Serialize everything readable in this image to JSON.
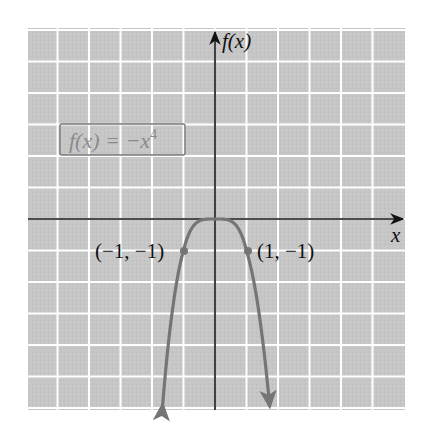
{
  "chart_data": {
    "type": "line",
    "title": "",
    "function_label": "f(x) = −x⁴",
    "xlabel": "x",
    "ylabel": "f(x)",
    "grid": true,
    "grid_step": 1,
    "xlim": [
      -5.9,
      6.0
    ],
    "ylim": [
      -6.0,
      5.9
    ],
    "series": [
      {
        "name": "f(x) = -x^4",
        "expression": "-x^4",
        "x": [
          -1.6,
          -1.2,
          -1.0,
          -0.8,
          -0.5,
          0,
          0.5,
          0.8,
          1.0,
          1.2,
          1.6
        ],
        "y": [
          -6.55,
          -2.07,
          -1,
          -0.41,
          -0.06,
          0,
          -0.06,
          -0.41,
          -1,
          -2.07,
          -6.55
        ]
      }
    ],
    "annotations": [
      {
        "point": [
          -1,
          -1
        ],
        "label": "(−1, −1)"
      },
      {
        "point": [
          1,
          -1
        ],
        "label": "(1, −1)"
      }
    ]
  },
  "labels": {
    "y_axis": "f(x)",
    "x_axis": "x",
    "function": "f(x) = −x",
    "function_exp": "4",
    "point_left": "(−1, −1)",
    "point_right": "(1, −1)"
  },
  "colors": {
    "grid_fill": "#c6c6c6",
    "grid_line": "#ffffff",
    "axis": "#111111",
    "curve": "#757575",
    "label_box": "#7a7a7a"
  }
}
